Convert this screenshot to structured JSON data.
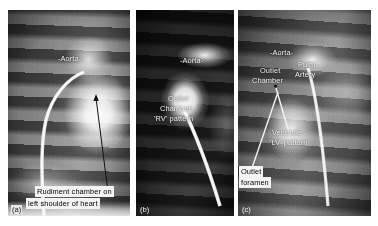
{
  "figure": {
    "type": "angiography-radiograph-triptych",
    "panels": [
      {
        "id": "a",
        "letter": "(a)",
        "labels": [
          {
            "name": "aorta-label",
            "text": "-Aorta-"
          },
          {
            "name": "rudiment-chamber-label-line1",
            "text": "Rudiment chamber on"
          },
          {
            "name": "rudiment-chamber-label-line2",
            "text": "left shoulder of heart"
          }
        ],
        "annotations": [
          "arrow pointing from caption up-left to rudimentary chamber",
          "curved catheter"
        ]
      },
      {
        "id": "b",
        "letter": "(b)",
        "labels": [
          {
            "name": "aorta-label",
            "text": "-Aorta-"
          },
          {
            "name": "outlet-chamber-label-line1",
            "text": "Outlet"
          },
          {
            "name": "outlet-chamber-label-line2",
            "text": "Chamber-"
          },
          {
            "name": "outlet-chamber-label-line3",
            "text": "'RV' pattern"
          }
        ],
        "annotations": [
          "diagonal catheter entering chamber"
        ]
      },
      {
        "id": "c",
        "letter": "(c)",
        "labels": [
          {
            "name": "aorta-label",
            "text": "-Aorta-"
          },
          {
            "name": "outlet-chamber-label-line1",
            "text": "Outlet"
          },
          {
            "name": "outlet-chamber-label-line2",
            "text": "Chamber"
          },
          {
            "name": "pulmonary-artery-label-line1",
            "text": "Pulm."
          },
          {
            "name": "pulmonary-artery-label-line2",
            "text": "Artery"
          },
          {
            "name": "ventricle-label-line1",
            "text": "Ventricle -"
          },
          {
            "name": "ventricle-label-line2",
            "text": "'LV' pattern"
          },
          {
            "name": "outlet-foramen-label-line1",
            "text": "Outlet"
          },
          {
            "name": "outlet-foramen-label-line2",
            "text": "foramen"
          }
        ],
        "annotations": [
          "leader line from 'Ventricle' text to chamber",
          "leader line from boxed 'Outlet foramen' caption up-right"
        ]
      }
    ]
  }
}
